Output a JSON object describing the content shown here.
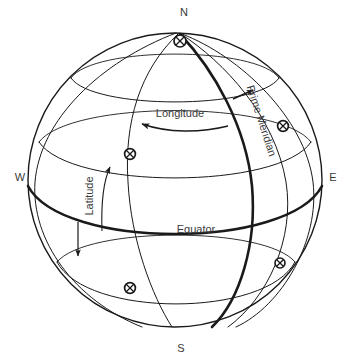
{
  "figure": {
    "name": "latitude-longitude-globe",
    "background": "#ffffff",
    "line_color": "#1a1a1a",
    "text_color": "#3a3a3a",
    "width": 350,
    "height": 362
  },
  "sphere": {
    "center_x": 175,
    "center_y": 180,
    "radius": 147,
    "outline_stroke_width": 1.4
  },
  "cardinals": {
    "north": {
      "label": "N",
      "x": 184,
      "y": 16
    },
    "south": {
      "label": "S",
      "x": 181,
      "y": 348
    },
    "west": {
      "label": "W",
      "x": 20,
      "y": 177
    },
    "east": {
      "label": "E",
      "x": 331,
      "y": 177
    }
  },
  "annotations": {
    "longitude": {
      "label": "Longitude",
      "x": 180,
      "y": 117,
      "arrow": "curved-left"
    },
    "latitude": {
      "label": "Latitude",
      "x": 93,
      "y": 196,
      "arrow": "straight-up",
      "rotation": -90
    },
    "equator": {
      "label": "Equator",
      "x": 196,
      "y": 233
    },
    "prime_meridian": {
      "label": "Prime Meridian",
      "x": 258,
      "y": 122,
      "rotation": 72
    }
  },
  "emphasis_lines": {
    "equator_stroke_width": 2.6,
    "prime_meridian_stroke_width": 2.6
  },
  "grid": {
    "latitude_circles": 3,
    "meridians": 5,
    "marker_count": 4,
    "marker_style": "crossed-circle",
    "marker_radius": 5.4
  },
  "markers": [
    {
      "name": "grid-marker-nw",
      "x": 130,
      "y": 154
    },
    {
      "name": "grid-marker-ne",
      "x": 283,
      "y": 126
    },
    {
      "name": "grid-marker-sw",
      "x": 130,
      "y": 288
    },
    {
      "name": "grid-marker-se",
      "x": 280,
      "y": 263
    },
    {
      "name": "north-pole-marker",
      "x": 180,
      "y": 41
    }
  ],
  "arrows": {
    "longitude_arrow": {
      "name": "longitude-direction-arrow",
      "direction": "left"
    },
    "latitude_arrow": {
      "name": "latitude-direction-arrow",
      "direction": "up"
    },
    "meridian_arrow": {
      "name": "prime-meridian-direction-arrow",
      "direction": "up-right"
    },
    "down_arrow": {
      "name": "southward-direction-arrow",
      "direction": "down"
    }
  }
}
